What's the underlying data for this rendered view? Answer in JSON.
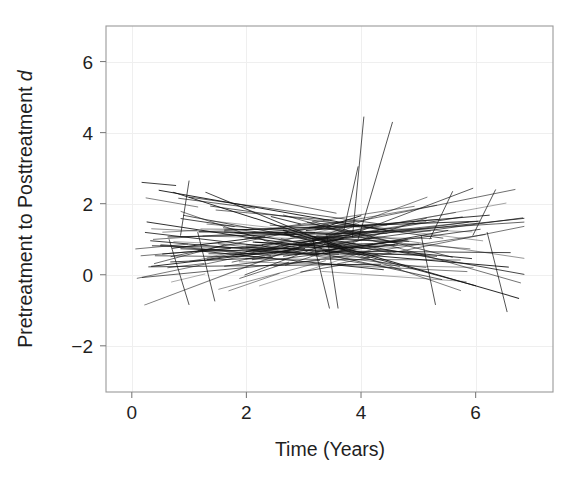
{
  "chart_data": {
    "type": "line",
    "title": "",
    "subtitle": "",
    "xlabel": "Time (Years)",
    "ylabel_main": "Pretreatment to Posttreatment ",
    "ylabel_italic": "d",
    "ylabel_full": "Pretreatment to Posttreatment d",
    "xlim": [
      -0.45,
      7.35
    ],
    "ylim": [
      -3.3,
      7.0
    ],
    "xticks": [
      0,
      2,
      4,
      6
    ],
    "xtick_labels": [
      "0",
      "2",
      "4",
      "6"
    ],
    "yticks": [
      -2,
      0,
      2,
      4,
      6
    ],
    "ytick_labels": [
      "−2",
      "0",
      "2",
      "4",
      "6"
    ],
    "grid": true,
    "grid_color": "#efefef",
    "legend": "none",
    "line_color": "#111111",
    "background_color": "#ffffff",
    "frame_color": "#9a9a9a",
    "n_lines": 132,
    "series_summary": {
      "intercept_mean": 0.98,
      "intercept_sd": 0.36,
      "slope_mean": 0.02,
      "slope_sd": 0.3,
      "start_time_min": 0.05,
      "start_time_max": 3.6,
      "duration_min": 0.5,
      "duration_max": 4.2,
      "d_observed_min": -1.05,
      "d_observed_max": 4.45
    },
    "outlier_lines": [
      {
        "x0": 3.85,
        "y0": 1.05,
        "x1": 4.05,
        "y1": 4.45
      },
      {
        "x0": 3.95,
        "y0": 1.0,
        "x1": 4.55,
        "y1": 4.3
      },
      {
        "x0": 3.7,
        "y0": 1.25,
        "x1": 3.95,
        "y1": 3.05
      },
      {
        "x0": 0.85,
        "y0": 1.1,
        "x1": 1.0,
        "y1": 2.65
      },
      {
        "x0": 1.15,
        "y0": 1.2,
        "x1": 1.45,
        "y1": -0.75
      },
      {
        "x0": 0.65,
        "y0": 1.0,
        "x1": 1.0,
        "y1": -0.85
      },
      {
        "x0": 3.15,
        "y0": 1.05,
        "x1": 3.45,
        "y1": -0.95
      },
      {
        "x0": 3.4,
        "y0": 1.15,
        "x1": 3.6,
        "y1": -0.95
      },
      {
        "x0": 5.05,
        "y0": 1.1,
        "x1": 5.3,
        "y1": -0.85
      },
      {
        "x0": 6.2,
        "y0": 1.2,
        "x1": 6.55,
        "y1": -1.05
      },
      {
        "x0": 5.95,
        "y0": 1.1,
        "x1": 6.35,
        "y1": 2.4
      },
      {
        "x0": 5.2,
        "y0": 1.0,
        "x1": 5.6,
        "y1": 2.35
      }
    ],
    "random_seed": 20240517
  },
  "geometry": {
    "plot_left": 106,
    "plot_right": 553,
    "plot_top": 26,
    "plot_bottom": 392
  }
}
